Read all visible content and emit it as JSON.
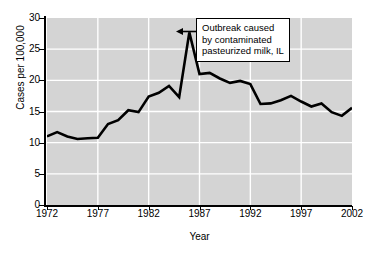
{
  "chart_data": {
    "type": "line",
    "title": "",
    "xlabel": "Year",
    "ylabel": "Cases per 100,000",
    "xlim": [
      1972,
      2002
    ],
    "ylim": [
      0,
      30
    ],
    "xticks": [
      "1972",
      "1977",
      "1982",
      "1987",
      "1992",
      "1997",
      "2002"
    ],
    "yticks": [
      "0",
      "5",
      "10",
      "15",
      "20",
      "25",
      "30"
    ],
    "grid": true,
    "legend": "none",
    "series": [
      {
        "name": "Cases per 100,000",
        "color": "#000000",
        "x": [
          1972,
          1973,
          1974,
          1975,
          1976,
          1977,
          1978,
          1979,
          1980,
          1981,
          1982,
          1983,
          1984,
          1985,
          1986,
          1987,
          1988,
          1989,
          1990,
          1991,
          1992,
          1993,
          1994,
          1995,
          1996,
          1997,
          1998,
          1999,
          2000,
          2001,
          2002
        ],
        "values": [
          11.0,
          11.7,
          11.0,
          10.6,
          10.7,
          10.8,
          13.0,
          13.6,
          15.2,
          14.9,
          17.4,
          18.0,
          19.1,
          17.3,
          27.7,
          21.0,
          21.2,
          20.3,
          19.6,
          19.9,
          19.4,
          16.2,
          16.3,
          16.8,
          17.5,
          16.6,
          15.8,
          16.3,
          14.9,
          14.3,
          15.6
        ]
      }
    ],
    "annotations": [
      {
        "name": "outbreak-callout",
        "lines": [
          "Outbreak caused",
          "by contaminated",
          "pasteurized milk, IL"
        ],
        "points_to_x": 1986,
        "points_to_y": 27.7
      }
    ],
    "style": {
      "plot_background": "#d4d4d4",
      "gridline_color": "#ffffff",
      "line_color": "#000000",
      "axis_color": "#000000",
      "callout_background": "#ffffff"
    }
  }
}
